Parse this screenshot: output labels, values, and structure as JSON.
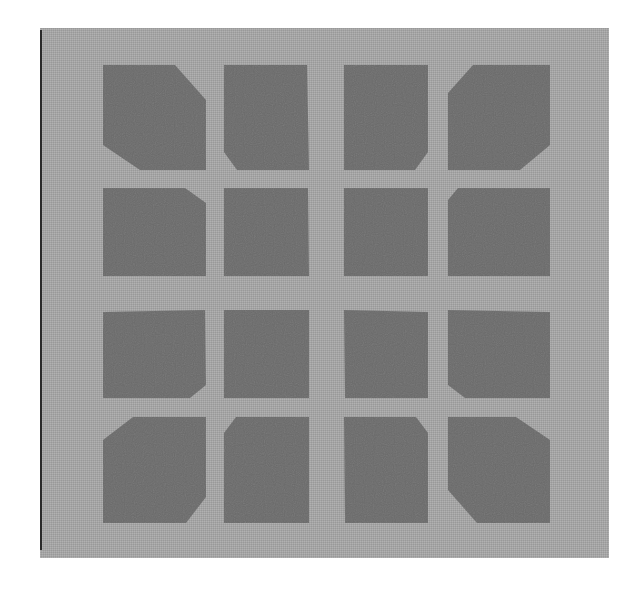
{
  "image": {
    "description": "Grayscale micrograph of a 4x4 array of dark square pads with chamfered outer corners on a lighter gray substrate",
    "colors": {
      "background": "#ffffff",
      "substrate": "#a9a9a9",
      "pad": "#6b6b6b",
      "edge_line": "#2a2a2a"
    },
    "grid": {
      "rows": 4,
      "cols": 4
    },
    "pads": [
      {
        "id": "r1c1",
        "points": "103,65 175,65 206,100 206,170 140,170 103,145"
      },
      {
        "id": "r1c2",
        "points": "224,65 307,65 309,170 237,170 224,152"
      },
      {
        "id": "r1c3",
        "points": "344,65 428,65 428,152 415,170 344,170"
      },
      {
        "id": "r1c4",
        "points": "473,65 550,65 550,145 520,170 448,170 448,93"
      },
      {
        "id": "r2c1",
        "points": "103,188 185,188 206,203 206,276 103,276"
      },
      {
        "id": "r2c2",
        "points": "224,188 308,188 309,276 224,276"
      },
      {
        "id": "r2c3",
        "points": "344,188 428,188 428,276 344,276"
      },
      {
        "id": "r2c4",
        "points": "458,188 550,188 550,276 448,276 448,200"
      },
      {
        "id": "r3c1",
        "points": "103,312 205,310 206,385 190,398 103,398"
      },
      {
        "id": "r3c2",
        "points": "224,310 309,310 309,398 224,398"
      },
      {
        "id": "r3c3",
        "points": "344,310 428,312 428,398 345,398"
      },
      {
        "id": "r3c4",
        "points": "448,310 550,312 550,398 465,398 448,385"
      },
      {
        "id": "r4c1",
        "points": "133,417 206,417 206,497 186,523 103,523 103,440"
      },
      {
        "id": "r4c2",
        "points": "236,417 309,417 309,523 224,523 224,433"
      },
      {
        "id": "r4c3",
        "points": "344,417 416,417 428,433 428,523 345,523"
      },
      {
        "id": "r4c4",
        "points": "448,417 516,417 550,440 550,523 477,523 448,490"
      }
    ]
  }
}
